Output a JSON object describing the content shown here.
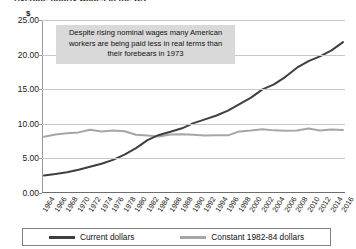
{
  "title": "Average hourly wages in the US",
  "y_axis_unit": "$",
  "annotation": {
    "line1": "Despite rising nominal wages many American",
    "line2": "workers are being paid less in real terms than",
    "line3": "their forebears in 1973"
  },
  "legend": [
    {
      "label": "Current dollars",
      "color": "#3f3f3f",
      "name": "legend-current-dollars"
    },
    {
      "label": "Constant 1982-84 dollars",
      "color": "#a6a6a6",
      "name": "legend-constant-dollars"
    }
  ],
  "y_ticks": [
    "25.00",
    "20.00",
    "15.00",
    "10.00",
    "5.00",
    "0.00"
  ],
  "chart_data": {
    "type": "line",
    "title": "Average hourly wages in the US",
    "xlabel": "",
    "ylabel": "$",
    "ylim": [
      0,
      25
    ],
    "ytick_step": 5,
    "grid": true,
    "legend_position": "bottom",
    "x": [
      1964,
      1966,
      1968,
      1970,
      1972,
      1974,
      1976,
      1978,
      1980,
      1982,
      1984,
      1986,
      1988,
      1990,
      1992,
      1994,
      1996,
      1998,
      2000,
      2002,
      2004,
      2006,
      2008,
      2010,
      2012,
      2014,
      2016
    ],
    "xtick_labels": [
      "1964",
      "1966",
      "1968",
      "1970",
      "1972",
      "1974",
      "1976",
      "1978",
      "1980",
      "1982",
      "1984",
      "1986",
      "1988",
      "1990",
      "1992",
      "1994",
      "1996",
      "1998",
      "2000",
      "2002",
      "2004",
      "2006",
      "2008",
      "2010",
      "2012",
      "2014",
      "2016"
    ],
    "series": [
      {
        "name": "Current dollars",
        "color": "#3f3f3f",
        "values": [
          2.53,
          2.73,
          3.01,
          3.36,
          3.79,
          4.22,
          4.79,
          5.54,
          6.48,
          7.64,
          8.39,
          8.85,
          9.35,
          10.1,
          10.64,
          11.2,
          11.9,
          12.85,
          13.78,
          14.97,
          15.69,
          16.79,
          18.11,
          19.06,
          19.74,
          20.62,
          21.8
        ]
      },
      {
        "name": "Constant 1982-84 dollars",
        "color": "#a6a6a6",
        "values": [
          8.12,
          8.46,
          8.65,
          8.76,
          9.15,
          8.89,
          9.02,
          8.93,
          8.41,
          8.3,
          8.15,
          8.45,
          8.48,
          8.4,
          8.3,
          8.35,
          8.33,
          8.9,
          9.04,
          9.22,
          9.05,
          9.01,
          9.02,
          9.31,
          9.04,
          9.18,
          9.12
        ]
      }
    ]
  }
}
